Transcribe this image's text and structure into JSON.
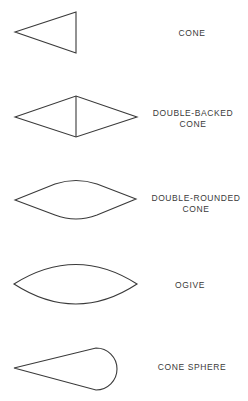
{
  "diagram": {
    "type": "nose-cone-shapes",
    "shapes": [
      {
        "id": "cone",
        "label_lines": [
          "CONE"
        ]
      },
      {
        "id": "double-backed-cone",
        "label_lines": [
          "DOUBLE-BACKED",
          "CONE"
        ]
      },
      {
        "id": "double-rounded-cone",
        "label_lines": [
          "DOUBLE-ROUNDED",
          "CONE"
        ]
      },
      {
        "id": "ogive",
        "label_lines": [
          "OGIVE"
        ]
      },
      {
        "id": "cone-sphere",
        "label_lines": [
          "CONE SPHERE"
        ]
      }
    ]
  }
}
